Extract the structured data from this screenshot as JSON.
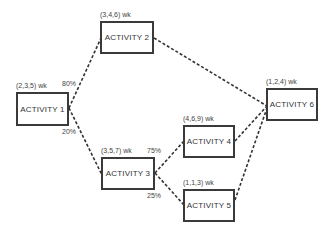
{
  "diagram": {
    "type": "activity-network",
    "nodes": [
      {
        "id": "a1",
        "label": "ACTIVITY 1",
        "duration": "(2,3,5) wk",
        "x": 16,
        "y": 92,
        "w": 53,
        "h": 34,
        "dx": 16,
        "dy": 82
      },
      {
        "id": "a2",
        "label": "ACTIVITY 2",
        "duration": "(3,4,6) wk",
        "x": 100,
        "y": 21,
        "w": 54,
        "h": 33,
        "dx": 100,
        "dy": 11
      },
      {
        "id": "a3",
        "label": "ACTIVITY 3",
        "duration": "(3,5,7) wk",
        "x": 101,
        "y": 157,
        "w": 54,
        "h": 33,
        "dx": 101,
        "dy": 147
      },
      {
        "id": "a4",
        "label": "ACTIVITY 4",
        "duration": "(4,6,9) wk",
        "x": 183,
        "y": 125,
        "w": 52,
        "h": 33,
        "dx": 183,
        "dy": 115
      },
      {
        "id": "a5",
        "label": "ACTIVITY 5",
        "duration": "(1,1,3) wk",
        "x": 183,
        "y": 189,
        "w": 52,
        "h": 33,
        "dx": 183,
        "dy": 179
      },
      {
        "id": "a6",
        "label": "ACTIVITY 6",
        "duration": "(1,2,4) wk",
        "x": 266,
        "y": 88,
        "w": 52,
        "h": 33,
        "dx": 266,
        "dy": 78
      }
    ],
    "edges": [
      {
        "from": "a1",
        "to": "a2",
        "probability": "80%"
      },
      {
        "from": "a1",
        "to": "a3",
        "probability": "20%"
      },
      {
        "from": "a2",
        "to": "a6",
        "probability": ""
      },
      {
        "from": "a3",
        "to": "a4",
        "probability": "75%"
      },
      {
        "from": "a3",
        "to": "a5",
        "probability": "25%"
      },
      {
        "from": "a4",
        "to": "a6",
        "probability": ""
      },
      {
        "from": "a5",
        "to": "a6",
        "probability": ""
      }
    ],
    "probability_labels": [
      {
        "text": "80%",
        "x": 62,
        "y": 80
      },
      {
        "text": "20%",
        "x": 62,
        "y": 128
      },
      {
        "text": "75%",
        "x": 147,
        "y": 147
      },
      {
        "text": "25%",
        "x": 147,
        "y": 192
      }
    ],
    "colors": {
      "line": "#333333",
      "border": "#3a3a3a",
      "text": "#333333"
    }
  }
}
